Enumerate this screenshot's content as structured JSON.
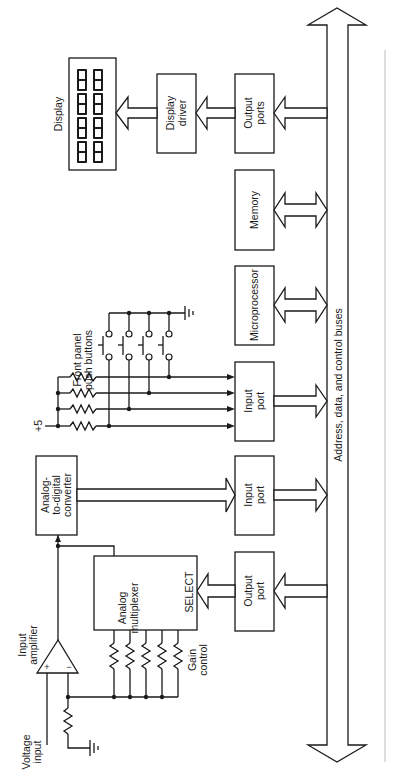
{
  "diagram": {
    "type": "block-diagram",
    "orientation": "rotated-90-ccw",
    "blocks": {
      "display": {
        "label": "Display",
        "digits": "8888"
      },
      "display_driver": {
        "line1": "Display",
        "line2": "driver"
      },
      "output_ports_display": {
        "line1": "Output",
        "line2": "ports"
      },
      "memory": {
        "label": "Memory"
      },
      "microprocessor": {
        "label": "Microprocessor"
      },
      "input_port_buttons": {
        "line1": "Input",
        "line2": "port"
      },
      "input_port_adc": {
        "line1": "Input",
        "line2": "port"
      },
      "output_port_mux": {
        "line1": "Output",
        "line2": "port"
      },
      "adc": {
        "line1": "Analog-",
        "line2": "to-digital",
        "line3": "converter"
      },
      "mux": {
        "line1": "Analog",
        "line2": "multiplexer",
        "select": "SELECT"
      },
      "amplifier": {
        "line1": "Input",
        "line2": "amplifier",
        "plus": "+",
        "minus": "−"
      }
    },
    "labels": {
      "push_buttons_line1": "Front panel",
      "push_buttons_line2": "push buttons",
      "supply": "+5",
      "gain_line1": "Gain",
      "gain_line2": "control",
      "voltage_line1": "Voltage",
      "voltage_line2": "input",
      "bus": "Address, data, and control buses"
    }
  }
}
